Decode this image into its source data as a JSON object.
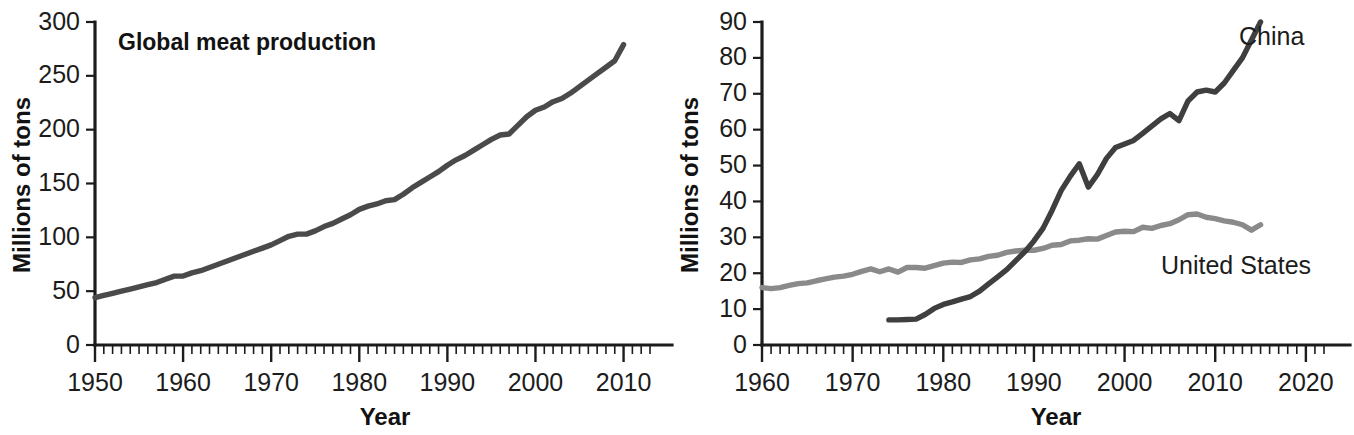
{
  "figure": {
    "background": "#ffffff",
    "width": 1354,
    "height": 435
  },
  "chart_data": [
    {
      "type": "line",
      "panel": "left",
      "title": "Global meat production",
      "xlabel": "Year",
      "ylabel": "Millions of tons",
      "xlim": [
        1950,
        2013
      ],
      "ylim": [
        0,
        300
      ],
      "yticks": [
        0,
        50,
        100,
        150,
        200,
        250,
        300
      ],
      "xticks": [
        1950,
        1960,
        1970,
        1980,
        1990,
        2000,
        2010
      ],
      "xtick_labels": [
        "1950",
        "1960",
        "1970",
        "1980",
        "1990",
        "2000",
        "2010"
      ],
      "ytick_labels": [
        "0",
        "50",
        "100",
        "150",
        "200",
        "250",
        "300"
      ],
      "minor_tick_interval": 1,
      "grid": false,
      "legend": "none",
      "series": [
        {
          "name": "Global meat production",
          "color": "#4a4a4a",
          "x": [
            1950,
            1951,
            1952,
            1953,
            1954,
            1955,
            1956,
            1957,
            1958,
            1959,
            1960,
            1961,
            1962,
            1963,
            1964,
            1965,
            1966,
            1967,
            1968,
            1969,
            1970,
            1971,
            1972,
            1973,
            1974,
            1975,
            1976,
            1977,
            1978,
            1979,
            1980,
            1981,
            1982,
            1983,
            1984,
            1985,
            1986,
            1987,
            1988,
            1989,
            1990,
            1991,
            1992,
            1993,
            1994,
            1995,
            1996,
            1997,
            1998,
            1999,
            2000,
            2001,
            2002,
            2003,
            2004,
            2005,
            2006,
            2007,
            2008,
            2009,
            2010
          ],
          "values": [
            44,
            46,
            48,
            50,
            52,
            54,
            56,
            58,
            61,
            64,
            64,
            67,
            69,
            72,
            75,
            78,
            81,
            84,
            87,
            90,
            93,
            97,
            101,
            103,
            103,
            106,
            110,
            113,
            117,
            121,
            126,
            129,
            131,
            134,
            135,
            140,
            146,
            151,
            156,
            161,
            167,
            172,
            176,
            181,
            186,
            191,
            195,
            196,
            204,
            212,
            218,
            221,
            226,
            229,
            234,
            240,
            246,
            252,
            258,
            264,
            279
          ]
        }
      ]
    },
    {
      "type": "line",
      "panel": "right",
      "title": "",
      "xlabel": "Year",
      "ylabel": "Millions of tons",
      "xlim": [
        1960,
        2022
      ],
      "ylim": [
        0,
        90
      ],
      "yticks": [
        0,
        10,
        20,
        30,
        40,
        50,
        60,
        70,
        80,
        90
      ],
      "xticks": [
        1960,
        1970,
        1980,
        1990,
        2000,
        2010,
        2020
      ],
      "xtick_labels": [
        "1960",
        "1970",
        "1980",
        "1990",
        "2000",
        "2010",
        "2020"
      ],
      "ytick_labels": [
        "0",
        "10",
        "20",
        "30",
        "40",
        "50",
        "60",
        "70",
        "80",
        "90"
      ],
      "minor_tick_interval": 1,
      "grid": false,
      "legend": "inline-labels",
      "series": [
        {
          "name": "China",
          "label": "China",
          "color": "#3f3f3f",
          "x": [
            1974,
            1975,
            1976,
            1977,
            1978,
            1979,
            1980,
            1981,
            1982,
            1983,
            1984,
            1985,
            1986,
            1987,
            1988,
            1989,
            1990,
            1991,
            1992,
            1993,
            1994,
            1995,
            1996,
            1997,
            1998,
            1999,
            2000,
            2001,
            2002,
            2003,
            2004,
            2005,
            2006,
            2007,
            2008,
            2009,
            2010,
            2011,
            2012,
            2013,
            2014,
            2015
          ],
          "values": [
            7.0,
            7.0,
            7.1,
            7.2,
            8.5,
            10.2,
            11.3,
            12.0,
            12.8,
            13.5,
            15.0,
            17.0,
            19.0,
            21.0,
            23.5,
            26.0,
            29.0,
            32.5,
            37.5,
            43.0,
            47.0,
            50.5,
            44.0,
            47.5,
            52.0,
            55.0,
            56.0,
            57.0,
            59.0,
            61.0,
            63.0,
            64.5,
            62.5,
            68.0,
            70.5,
            71.0,
            70.5,
            73.0,
            76.5,
            80.0,
            85.0,
            90.0
          ]
        },
        {
          "name": "United States",
          "label": "United States",
          "color": "#8a8a8a",
          "x": [
            1960,
            1961,
            1962,
            1963,
            1964,
            1965,
            1966,
            1967,
            1968,
            1969,
            1970,
            1971,
            1972,
            1973,
            1974,
            1975,
            1976,
            1977,
            1978,
            1979,
            1980,
            1981,
            1982,
            1983,
            1984,
            1985,
            1986,
            1987,
            1988,
            1989,
            1990,
            1991,
            1992,
            1993,
            1994,
            1995,
            1996,
            1997,
            1998,
            1999,
            2000,
            2001,
            2002,
            2003,
            2004,
            2005,
            2006,
            2007,
            2008,
            2009,
            2010,
            2011,
            2012,
            2013,
            2014,
            2015
          ],
          "values": [
            16.0,
            15.7,
            16.0,
            16.6,
            17.1,
            17.3,
            17.9,
            18.4,
            18.9,
            19.2,
            19.7,
            20.5,
            21.2,
            20.4,
            21.2,
            20.3,
            21.6,
            21.6,
            21.4,
            22.1,
            22.8,
            23.1,
            23.0,
            23.7,
            24.0,
            24.7,
            25.0,
            25.8,
            26.2,
            26.4,
            26.4,
            26.9,
            27.8,
            28.0,
            29.0,
            29.2,
            29.6,
            29.5,
            30.5,
            31.5,
            31.7,
            31.6,
            32.8,
            32.5,
            33.3,
            33.8,
            34.9,
            36.3,
            36.5,
            35.6,
            35.2,
            34.6,
            34.2,
            33.5,
            32.0,
            33.5
          ]
        }
      ]
    }
  ]
}
